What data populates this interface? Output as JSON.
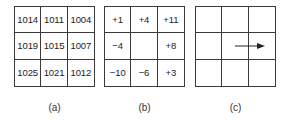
{
  "panels": [
    {
      "id": "a",
      "label": "(a)",
      "cells": [
        [
          "1014",
          "1011",
          "1004"
        ],
        [
          "1019",
          "1015",
          "1007"
        ],
        [
          "1025",
          "1021",
          "1012"
        ]
      ]
    },
    {
      "id": "b",
      "label": "(b)",
      "cells": [
        [
          "+1",
          "+4",
          "+11"
        ],
        [
          "−4",
          "",
          "+8"
        ],
        [
          "−10",
          "−6",
          "+3"
        ]
      ]
    },
    {
      "id": "c",
      "label": "(c)",
      "cells": [
        [
          "",
          "",
          ""
        ],
        [
          "",
          "",
          ""
        ],
        [
          "",
          "",
          ""
        ]
      ],
      "arrow": {
        "icon": "right-arrow-icon",
        "from_cell": [
          1,
          1
        ],
        "direction": "east"
      }
    }
  ],
  "colors": {
    "grid_line": "#3a3a3a",
    "text": "#222222",
    "background": "#ffffff"
  }
}
